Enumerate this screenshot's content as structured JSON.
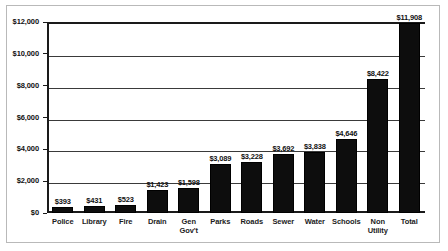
{
  "chart_data": {
    "type": "bar",
    "title": "",
    "xlabel": "",
    "ylabel": "",
    "ylim": [
      0,
      12000
    ],
    "grid": true,
    "legend": "none",
    "categories": [
      "Police",
      "Library",
      "Fire",
      "Drain",
      "Gen\nGov't",
      "Parks",
      "Roads",
      "Sewer",
      "Water",
      "Schools",
      "Non\nUtility",
      "Total"
    ],
    "values": [
      393,
      431,
      523,
      1423,
      1598,
      3089,
      3228,
      3692,
      3838,
      4646,
      8422,
      11908
    ],
    "value_labels": [
      "$393",
      "$431",
      "$523",
      "$1,423",
      "$1,598",
      "$3,089",
      "$3,228",
      "$3,692",
      "$3,838",
      "$4,646",
      "$8,422",
      "$11,908"
    ],
    "ytick_values": [
      0,
      2000,
      4000,
      6000,
      8000,
      10000,
      12000
    ],
    "ytick_labels": [
      "$0",
      "$2,000",
      "$4,000",
      "$6,000",
      "$8,000",
      "$10,000",
      "$12,000"
    ],
    "bar_color": "#0d0d0d",
    "grid_color": "#3a3a3a",
    "axis_color": "#1a1a1a",
    "background": "#ffffff"
  }
}
